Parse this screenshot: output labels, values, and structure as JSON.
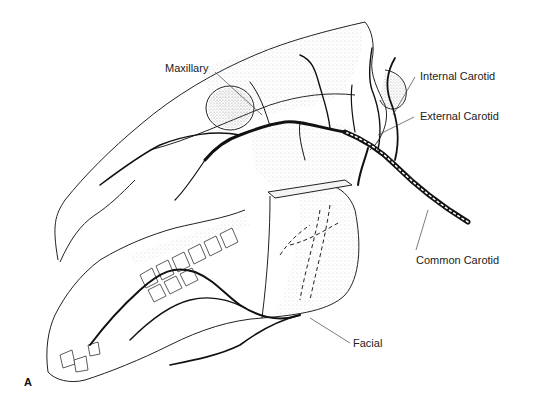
{
  "figure": {
    "panel_label": "A",
    "labels": {
      "maxillary": "Maxillary",
      "internal_carotid": "Internal Carotid",
      "external_carotid": "External Carotid",
      "common_carotid": "Common Carotid",
      "facial": "Facial"
    },
    "colors": {
      "background": "#ffffff",
      "line": "#111111",
      "stipple": "#bdbdbd",
      "label_text": "#222222"
    }
  }
}
